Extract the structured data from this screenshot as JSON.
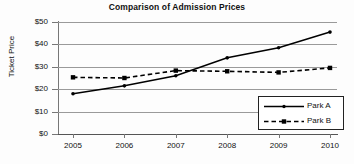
{
  "chart_data": {
    "type": "line",
    "title": "Comparison of Admission Prices",
    "xlabel": "",
    "ylabel": "Ticket Price",
    "categories": [
      "2005",
      "2006",
      "2007",
      "2008",
      "2009",
      "2010"
    ],
    "x": [
      2005,
      2006,
      2007,
      2008,
      2009,
      2010
    ],
    "series": [
      {
        "name": "Park A",
        "values": [
          18.0,
          21.5,
          26.0,
          34.0,
          38.5,
          45.5
        ],
        "style": "solid",
        "marker": "dot",
        "color": "#000000"
      },
      {
        "name": "Park B",
        "values": [
          25.3,
          25.0,
          28.3,
          28.0,
          27.5,
          29.5
        ],
        "style": "dashed",
        "marker": "square",
        "color": "#000000"
      }
    ],
    "ylim": [
      0,
      50
    ],
    "ytick_values": [
      0,
      10,
      20,
      30,
      40,
      50
    ],
    "ytick_labels": [
      "$0",
      "$10",
      "$20",
      "$30",
      "$40",
      "$50"
    ],
    "grid": true,
    "grid_axis": "y",
    "legend_position": "lower-right",
    "legend_entries": [
      "Park A",
      "Park B"
    ],
    "colors": {
      "line": "#000000",
      "grid": "#9a9a9a",
      "axis": "#777777",
      "text": "#111111",
      "background": "#fdfdfd"
    }
  }
}
